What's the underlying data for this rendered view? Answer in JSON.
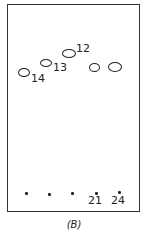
{
  "figure": {
    "caption": "(B)"
  },
  "spots": [
    {
      "label": "14",
      "x": 24,
      "y": 73
    },
    {
      "label": "13",
      "x": 46,
      "y": 63
    },
    {
      "label": "12",
      "x": 69,
      "y": 53
    },
    {
      "label": "",
      "x": 95,
      "y": 68
    },
    {
      "label": "",
      "x": 115,
      "y": 68
    }
  ],
  "origin": {
    "lanes": [
      {
        "x": 26,
        "label": ""
      },
      {
        "x": 49,
        "label": ""
      },
      {
        "x": 72,
        "label": ""
      },
      {
        "x": 96,
        "label": "21"
      },
      {
        "x": 119,
        "label": "24"
      }
    ]
  },
  "labels": {
    "spot_14": "14",
    "spot_13": "13",
    "spot_12": "12",
    "lane_21": "21",
    "lane_24": "24"
  }
}
